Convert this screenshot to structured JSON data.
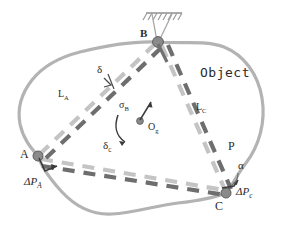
{
  "figure": {
    "type": "mechanics-schematic",
    "canvas": {
      "width": 283,
      "height": 227
    },
    "colors": {
      "outline": "#b3b3b3",
      "link_undeformed": "#c2c2c2",
      "link_deformed": "#6e6e6e",
      "node": "#8c8c8c",
      "node_dark": "#4a4a4a",
      "text": "#2b2b2b",
      "support": "#9a9a9a",
      "arrow": "#3a3a3a",
      "background": "#ffffff"
    }
  },
  "labels": {
    "object": "Object",
    "node_a": "A",
    "node_b": "B",
    "node_c": "C",
    "point_p": "P",
    "link_a": "L",
    "link_a_sub": "A",
    "link_c": "L",
    "link_c_sub": "C",
    "delta": "δ",
    "delta_c": "δ",
    "delta_c_sub": "c",
    "sigma_b": "σ",
    "sigma_b_sub": "B",
    "origin": "O",
    "origin_sub": "g",
    "alpha": "α",
    "dp_a": "ΔP",
    "dp_a_sub": "A",
    "dp_c": "ΔP",
    "dp_c_sub": "c"
  },
  "nodes": [
    {
      "id": "A",
      "label": "A",
      "x": 38,
      "y": 156,
      "kind": "pin-joint"
    },
    {
      "id": "B",
      "label": "B",
      "x": 157,
      "y": 42,
      "kind": "fixed-support"
    },
    {
      "id": "C",
      "label": "C",
      "x": 226,
      "y": 193,
      "kind": "pin-joint"
    }
  ],
  "links": [
    {
      "id": "L_A",
      "from": "A",
      "to": "B",
      "label": "L_A",
      "style": "dashed"
    },
    {
      "id": "L_C",
      "from": "B",
      "to": "C",
      "label": "L_C",
      "style": "dashed"
    },
    {
      "id": "L_AC",
      "from": "A",
      "to": "C",
      "label": "",
      "style": "dashed"
    }
  ],
  "annotations": [
    {
      "name": "delta-gap",
      "symbol": "δ",
      "meaning": "link gap / offset"
    },
    {
      "name": "sigma-b-vector",
      "symbol": "σ_B",
      "meaning": "translation vector"
    },
    {
      "name": "delta-c-rotation",
      "symbol": "δ_c",
      "meaning": "rotation of object frame"
    },
    {
      "name": "origin-marker",
      "symbol": "O_g",
      "meaning": "object frame origin"
    },
    {
      "name": "alpha-angle",
      "symbol": "α",
      "meaning": "angle at C"
    },
    {
      "name": "dp-a-vector",
      "symbol": "ΔP_A",
      "meaning": "displacement at A"
    },
    {
      "name": "dp-c-vector",
      "symbol": "ΔP_c",
      "meaning": "displacement at C"
    }
  ]
}
